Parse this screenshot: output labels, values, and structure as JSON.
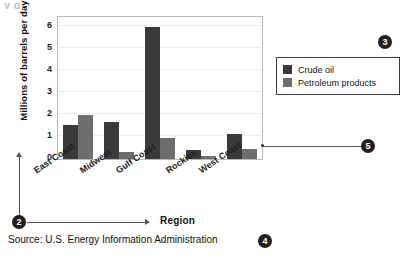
{
  "figure": {
    "title_remnant": "y g",
    "source_text": "Source: U.S. Energy Information Administration"
  },
  "chart_data": {
    "type": "bar",
    "title": "",
    "subtitle": "",
    "xlabel": "Region",
    "ylabel": "Millions of barrels per day",
    "categories": [
      "East Coast",
      "Midwest",
      "Gulf Coast",
      "Rockies",
      "West Coast"
    ],
    "series": [
      {
        "name": "Crude oil",
        "color": "#3a3a3a",
        "values": [
          1.5,
          1.65,
          5.85,
          0.4,
          1.1
        ]
      },
      {
        "name": "Petroleum products",
        "color": "#6e6e6e",
        "values": [
          1.95,
          0.3,
          0.95,
          0.15,
          0.45
        ]
      }
    ],
    "ylim": [
      0,
      6.4
    ],
    "yticks": [
      "0",
      "1",
      "2",
      "3",
      "4",
      "5",
      "6"
    ],
    "grid": true,
    "legend_position": "right",
    "annotation": "Source: U.S. Energy Information Administration"
  },
  "callouts": [
    {
      "id": "2",
      "label": "2"
    },
    {
      "id": "3",
      "label": "3"
    },
    {
      "id": "4",
      "label": "4"
    },
    {
      "id": "5",
      "label": "5"
    }
  ],
  "yticks": [
    {
      "label": "6"
    },
    {
      "label": "5"
    },
    {
      "label": "4"
    },
    {
      "label": "3"
    },
    {
      "label": "2"
    },
    {
      "label": "1"
    },
    {
      "label": "0"
    }
  ]
}
